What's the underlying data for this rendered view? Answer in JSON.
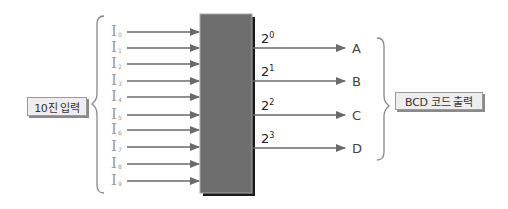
{
  "diagram": {
    "input_box_label": "10진 입력",
    "output_box_label": "BCD 코드 출력",
    "inputs": [
      {
        "base": "I",
        "sub": "0"
      },
      {
        "base": "I",
        "sub": "1"
      },
      {
        "base": "I",
        "sub": "2"
      },
      {
        "base": "I",
        "sub": "3"
      },
      {
        "base": "I",
        "sub": "4"
      },
      {
        "base": "I",
        "sub": "5"
      },
      {
        "base": "I",
        "sub": "6"
      },
      {
        "base": "I",
        "sub": "7"
      },
      {
        "base": "I",
        "sub": "8"
      },
      {
        "base": "I",
        "sub": "9"
      }
    ],
    "outputs": [
      {
        "weight_base": "2",
        "weight_exp": "0",
        "letter": "A"
      },
      {
        "weight_base": "2",
        "weight_exp": "1",
        "letter": "B"
      },
      {
        "weight_base": "2",
        "weight_exp": "2",
        "letter": "C"
      },
      {
        "weight_base": "2",
        "weight_exp": "3",
        "letter": "D"
      }
    ],
    "colors": {
      "block_fill": "#6e6e6e",
      "block_shadow": "#1a1a1a",
      "arrow": "#6a6a6a",
      "brace": "#888888",
      "label_box_fill": "#eeeeee"
    }
  }
}
